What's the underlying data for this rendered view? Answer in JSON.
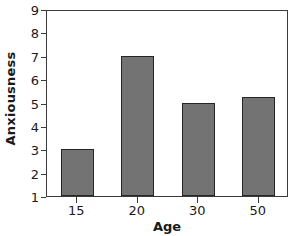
{
  "chart_data": {
    "type": "bar",
    "title": "",
    "xlabel": "Age",
    "ylabel": "Anxiousness",
    "categories": [
      "15",
      "20",
      "30",
      "50"
    ],
    "values": [
      3,
      7,
      5,
      5.25
    ],
    "ylim": [
      1,
      9
    ],
    "yticks": [
      "1",
      "2",
      "3",
      "4",
      "5",
      "6",
      "7",
      "8",
      "9"
    ],
    "grid": false,
    "legend": false,
    "bar_fill_color": "#737373",
    "bar_edge_color": "#262626",
    "axis_color": "#3b3b3b",
    "text_color": "#1a1a1a",
    "background_color": "#ffffff"
  }
}
